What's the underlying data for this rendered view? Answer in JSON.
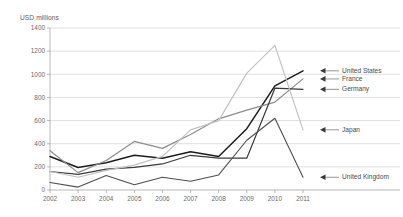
{
  "chart_data": {
    "type": "line",
    "title": "",
    "ylabel": "USD millions",
    "xlabel": "",
    "ylim": [
      0,
      1400
    ],
    "ytick_step": 200,
    "yticks": [
      "0",
      "200",
      "400",
      "600",
      "800",
      "1000",
      "1200",
      "1400"
    ],
    "grid": true,
    "legend_position": "right-inline-arrows",
    "categories": [
      "2002",
      "2003",
      "2004",
      "2005",
      "2006",
      "2007",
      "2008",
      "2009",
      "2010",
      "2011"
    ],
    "series": [
      {
        "name": "United States",
        "color": "#1d1d1d",
        "width": 1.5,
        "values": [
          290,
          195,
          235,
          300,
          275,
          330,
          290,
          530,
          900,
          1030
        ]
      },
      {
        "name": "France",
        "color": "#8d8d8d",
        "width": 1.2,
        "values": [
          340,
          150,
          255,
          420,
          360,
          480,
          615,
          690,
          760,
          960
        ]
      },
      {
        "name": "Germany",
        "color": "#3a3a3a",
        "width": 1.2,
        "values": [
          160,
          135,
          180,
          195,
          225,
          300,
          275,
          275,
          880,
          870
        ]
      },
      {
        "name": "Japan",
        "color": "#c2c2c2",
        "width": 1.2,
        "values": [
          160,
          110,
          170,
          215,
          290,
          520,
          600,
          1010,
          1250,
          520
        ]
      },
      {
        "name": "United Kingdom",
        "color": "#4f4f4f",
        "width": 1.1,
        "values": [
          65,
          25,
          125,
          45,
          110,
          75,
          130,
          430,
          620,
          110
        ]
      }
    ],
    "legend": [
      {
        "label": "United States",
        "value_at_end": 1030
      },
      {
        "label": "France",
        "value_at_end": 960
      },
      {
        "label": "Germany",
        "value_at_end": 870
      },
      {
        "label": "Japan",
        "value_at_end": 520
      },
      {
        "label": "United Kingdom",
        "value_at_end": 110
      }
    ]
  }
}
